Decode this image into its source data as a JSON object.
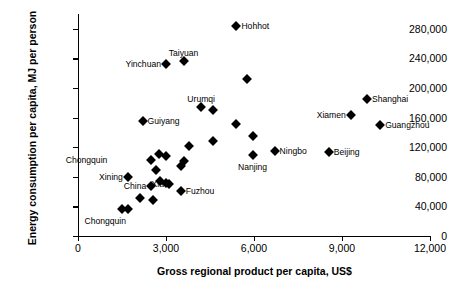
{
  "chart_data": {
    "type": "scatter",
    "title": "",
    "xlabel": "Gross regional product per capita, US$",
    "ylabel": "Energy consumption per capita, MJ per person",
    "xlim": [
      0,
      12000
    ],
    "ylim": [
      0,
      300000
    ],
    "grid": false,
    "legend": "none",
    "xticks": [
      0,
      3000,
      6000,
      9000,
      12000
    ],
    "xticklabels": [
      "0",
      "3,000",
      "6,000",
      "9,000",
      "12,000"
    ],
    "yticks": [
      0,
      40000,
      80000,
      120000,
      160000,
      200000,
      240000,
      280000
    ],
    "yticklabels": [
      "0",
      "40,000",
      "80,000",
      "120,000",
      "160,000",
      "200,000",
      "240,000",
      "280,000"
    ],
    "marker": "diamond",
    "marker_color": "#000000",
    "points": [
      {
        "label": "Hohhot",
        "x": 5400,
        "y": 284000,
        "pos": "r"
      },
      {
        "label": "Taiyuan",
        "x": 3600,
        "y": 237000,
        "pos": "t"
      },
      {
        "label": "Yinchuan",
        "x": 3000,
        "y": 233000,
        "pos": "l"
      },
      {
        "label": "",
        "x": 5750,
        "y": 212000,
        "pos": "r"
      },
      {
        "label": "Shanghai",
        "x": 9850,
        "y": 185000,
        "pos": "r"
      },
      {
        "label": "Urumqi",
        "x": 4200,
        "y": 174000,
        "pos": "t"
      },
      {
        "label": "",
        "x": 4600,
        "y": 170000,
        "pos": "r"
      },
      {
        "label": "Xiamen",
        "x": 9300,
        "y": 163000,
        "pos": "l"
      },
      {
        "label": "Guiyang",
        "x": 2200,
        "y": 155000,
        "pos": "r"
      },
      {
        "label": "",
        "x": 5400,
        "y": 151000,
        "pos": "r"
      },
      {
        "label": "Guangzhou",
        "x": 10300,
        "y": 150000,
        "pos": "r"
      },
      {
        "label": "",
        "x": 5950,
        "y": 135000,
        "pos": "r"
      },
      {
        "label": "",
        "x": 4600,
        "y": 128000,
        "pos": "r"
      },
      {
        "label": "",
        "x": 3800,
        "y": 121000,
        "pos": "r"
      },
      {
        "label": "Ningbo",
        "x": 6700,
        "y": 115000,
        "pos": "r"
      },
      {
        "label": "Beijing",
        "x": 8550,
        "y": 114000,
        "pos": "r"
      },
      {
        "label": "",
        "x": 2750,
        "y": 111000,
        "pos": "r"
      },
      {
        "label": "Nanjing",
        "x": 5950,
        "y": 110000,
        "pos": "b"
      },
      {
        "label": "",
        "x": 3000,
        "y": 108000,
        "pos": "r"
      },
      {
        "label": "Chongquin",
        "x": 2500,
        "y": 103000,
        "pos": "lfar2"
      },
      {
        "label": "",
        "x": 3600,
        "y": 102000,
        "pos": "r"
      },
      {
        "label": "",
        "x": 3500,
        "y": 94000,
        "pos": "r"
      },
      {
        "label": "",
        "x": 2650,
        "y": 89000,
        "pos": "r"
      },
      {
        "label": "Xining",
        "x": 1700,
        "y": 80000,
        "pos": "l"
      },
      {
        "label": "",
        "x": 2800,
        "y": 75000,
        "pos": "r"
      },
      {
        "label": "",
        "x": 3000,
        "y": 71000,
        "pos": "r"
      },
      {
        "label": "Xia",
        "x": 3100,
        "y": 70000,
        "pos": "l"
      },
      {
        "label": "China",
        "x": 2500,
        "y": 67000,
        "pos": "l"
      },
      {
        "label": "Fuzhou",
        "x": 3500,
        "y": 61000,
        "pos": "r"
      },
      {
        "label": "",
        "x": 2100,
        "y": 51000,
        "pos": "r"
      },
      {
        "label": "",
        "x": 2550,
        "y": 49000,
        "pos": "r"
      },
      {
        "label": "Chongquin",
        "x": 1500,
        "y": 37000,
        "pos": "bl"
      },
      {
        "label": "",
        "x": 1700,
        "y": 37000,
        "pos": "r"
      }
    ]
  }
}
